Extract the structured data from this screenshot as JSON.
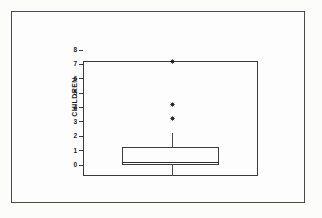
{
  "figure": {
    "axis_title": "CHILDREN",
    "frame_color": "#3a3a3a",
    "marker_color": "#111111",
    "background": "#fdfdfd"
  },
  "chart_data": {
    "type": "box",
    "title": "",
    "xlabel": "",
    "ylabel": "CHILDREN",
    "ylim": [
      0,
      8
    ],
    "ytick_labels": [
      "8",
      "7",
      "6",
      "5",
      "4",
      "3",
      "2",
      "1",
      "0"
    ],
    "ytick_values": [
      8,
      7,
      6,
      5,
      4,
      3,
      2,
      1,
      0
    ],
    "grid": false,
    "legend": false,
    "categories": [
      ""
    ],
    "series": [
      {
        "name": "CHILDREN",
        "min": 0,
        "q1": 0.8,
        "median": 1,
        "q3": 2,
        "whisker_low": 0,
        "whisker_high": 3,
        "outliers": [
          4,
          5,
          8
        ],
        "outlier_marker": "asterisk"
      }
    ]
  }
}
